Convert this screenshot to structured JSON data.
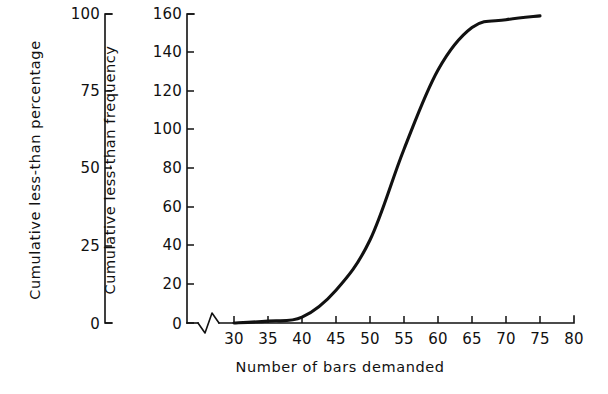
{
  "figure": {
    "background_color": "#ffffff",
    "ink_color": "#111111"
  },
  "chart_data": {
    "type": "line",
    "title": "",
    "subtitle": "",
    "xlabel": "Number of bars demanded",
    "ylabel": "Cumulative less-than frequency",
    "ylabel_secondary": "Cumulative less-than percentage",
    "grid": false,
    "legend": false,
    "legend_position": "none",
    "axis_break": {
      "axis": "x",
      "present": true,
      "symbol": "zigzag",
      "between": [
        0,
        30
      ]
    },
    "xlim": [
      25,
      80
    ],
    "ylim": [
      0,
      160
    ],
    "ylim_secondary": [
      0,
      100
    ],
    "xticks": [
      30,
      35,
      40,
      45,
      50,
      55,
      60,
      65,
      70,
      75,
      80
    ],
    "xticklabels": [
      "30",
      "35",
      "40",
      "45",
      "50",
      "55",
      "60",
      "65",
      "70",
      "75",
      "80"
    ],
    "yticks": [
      0,
      20,
      40,
      60,
      80,
      100,
      120,
      140,
      160
    ],
    "yticklabels": [
      "0",
      "20",
      "40",
      "60",
      "80",
      "100",
      "120",
      "140",
      "160"
    ],
    "yticks_secondary": [
      0,
      25,
      50,
      75,
      100
    ],
    "yticklabels_secondary": [
      "0",
      "25",
      "50",
      "75",
      "100"
    ],
    "x": [
      30,
      35,
      40,
      45,
      50,
      55,
      60,
      65,
      70,
      75
    ],
    "values": [
      0,
      1,
      3,
      17,
      43,
      90,
      131,
      153,
      157,
      159
    ],
    "series": [
      {
        "name": "Cumulative less-than frequency",
        "x": [
          30,
          35,
          40,
          45,
          50,
          55,
          60,
          65,
          70,
          75
        ],
        "values": [
          0,
          1,
          3,
          17,
          43,
          90,
          131,
          153,
          157,
          159
        ],
        "values_percentage": [
          0,
          0.6,
          1.9,
          10.6,
          26.9,
          56.3,
          81.9,
          95.6,
          98.1,
          99.4
        ],
        "color": "#111111",
        "line_width": 3.1,
        "marker": "none"
      }
    ]
  },
  "axes": {
    "percentage_axis": {
      "name": "Cumulative less-than percentage",
      "ticks": [
        "100",
        "75",
        "50",
        "25",
        "0"
      ]
    },
    "frequency_axis": {
      "name": "Cumulative less-than frequency",
      "ticks": [
        "160",
        "140",
        "120",
        "100",
        "80",
        "60",
        "40",
        "20",
        "0"
      ]
    },
    "x_axis": {
      "name": "Number of bars demanded",
      "ticks": [
        "30",
        "35",
        "40",
        "45",
        "50",
        "55",
        "60",
        "65",
        "70",
        "75",
        "80"
      ]
    }
  }
}
